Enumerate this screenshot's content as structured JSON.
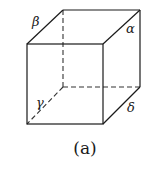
{
  "figure": {
    "caption": "(a)",
    "shape": "cube",
    "edge_labels": {
      "alpha": "α",
      "beta": "β",
      "gamma": "γ",
      "delta": "δ"
    },
    "colors": {
      "line": "#1a1a1a",
      "background": "#ffffff"
    }
  }
}
